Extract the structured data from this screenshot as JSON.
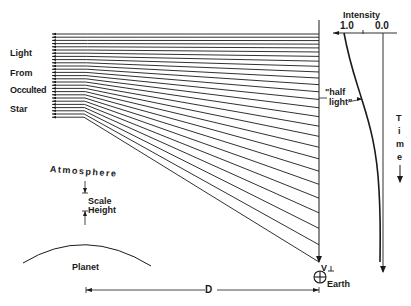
{
  "labels": {
    "light": "Light",
    "from": "From",
    "occulted": "Occulted",
    "star": "Star",
    "atmosphere": "Atmosphere",
    "scale": "Scale",
    "height": "Height",
    "planet": "Planet",
    "distance": "D",
    "earth": "Earth",
    "v_perp": "V",
    "intensity": "Intensity",
    "tick_high": "1.0",
    "tick_low": "0.0",
    "half_light_1": "\"half",
    "half_light_2": "light\"",
    "time": [
      "T",
      "i",
      "m",
      "e"
    ]
  },
  "colors": {
    "ink": "#1a1a1a",
    "background": "#ffffff"
  },
  "rays": {
    "count": 27,
    "left_x": 52,
    "bend_x": 88,
    "observer_x": 319,
    "top_y": 34,
    "spacing": 3.2
  }
}
